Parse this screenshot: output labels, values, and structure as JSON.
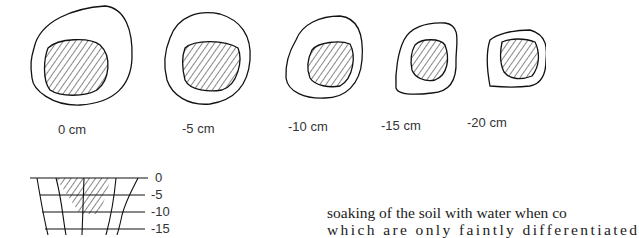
{
  "figure": {
    "sections": [
      {
        "label": "0 cm"
      },
      {
        "label": "-5 cm"
      },
      {
        "label": "-10 cm"
      },
      {
        "label": "-15 cm"
      },
      {
        "label": "-20 cm"
      }
    ],
    "profile_depths": [
      "0",
      "-5",
      "-10",
      "-15"
    ]
  },
  "text": {
    "line1": "soaking of the soil with water when co",
    "line2": "which are only faintly differentiated"
  }
}
